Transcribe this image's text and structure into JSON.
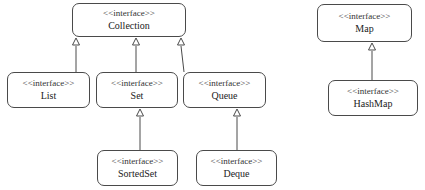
{
  "diagram": {
    "type": "uml-class-hierarchy",
    "nodes": [
      {
        "id": "collection",
        "stereotype": "<<interface>>",
        "name": "Collection",
        "x": 72,
        "y": 3,
        "w": 114,
        "h": 34
      },
      {
        "id": "list",
        "stereotype": "<<interface>>",
        "name": "List",
        "x": 7,
        "y": 72,
        "w": 83,
        "h": 36
      },
      {
        "id": "set",
        "stereotype": "<<interface>>",
        "name": "Set",
        "x": 96,
        "y": 72,
        "w": 82,
        "h": 36
      },
      {
        "id": "queue",
        "stereotype": "<<interface>>",
        "name": "Queue",
        "x": 183,
        "y": 72,
        "w": 83,
        "h": 36
      },
      {
        "id": "sortedset",
        "stereotype": "<<interface>>",
        "name": "SortedSet",
        "x": 97,
        "y": 150,
        "w": 81,
        "h": 36
      },
      {
        "id": "deque",
        "stereotype": "<<interface>>",
        "name": "Deque",
        "x": 196,
        "y": 150,
        "w": 81,
        "h": 36
      },
      {
        "id": "map",
        "stereotype": "<<interface>>",
        "name": "Map",
        "x": 317,
        "y": 4,
        "w": 95,
        "h": 38
      },
      {
        "id": "hashmap",
        "stereotype": "<<interface>>",
        "name": "HashMap",
        "x": 328,
        "y": 80,
        "w": 90,
        "h": 36
      }
    ],
    "edges": [
      {
        "from": "list",
        "to": "collection",
        "kind": "generalization"
      },
      {
        "from": "set",
        "to": "collection",
        "kind": "generalization"
      },
      {
        "from": "queue",
        "to": "collection",
        "kind": "generalization"
      },
      {
        "from": "sortedset",
        "to": "set",
        "kind": "generalization"
      },
      {
        "from": "deque",
        "to": "queue",
        "kind": "generalization"
      },
      {
        "from": "hashmap",
        "to": "map",
        "kind": "generalization"
      }
    ],
    "colors": {
      "stroke": "#4a4a4a",
      "text": "#222222",
      "background": "#ffffff"
    }
  }
}
